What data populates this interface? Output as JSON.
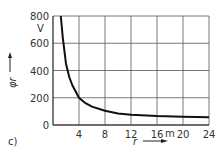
{
  "panel_label": "c)",
  "chart_data": {
    "type": "line",
    "title": "",
    "xlabel": "r",
    "x_unit": "m",
    "ylabel": "φr",
    "y_unit": "V",
    "xlim": [
      0,
      24
    ],
    "ylim": [
      0,
      800
    ],
    "x_ticks": [
      "4",
      "8",
      "12",
      "16",
      "20",
      "24"
    ],
    "y_ticks": [
      "0",
      "200",
      "400",
      "600",
      "800"
    ],
    "grid": true,
    "series": [
      {
        "name": "φr(r)",
        "x": [
          1.2,
          1.5,
          2,
          2.5,
          3,
          4,
          5,
          6,
          8,
          10,
          12,
          16,
          20,
          24
        ],
        "values": [
          800,
          640,
          450,
          350,
          290,
          200,
          160,
          135,
          105,
          85,
          75,
          65,
          60,
          57
        ]
      }
    ]
  }
}
